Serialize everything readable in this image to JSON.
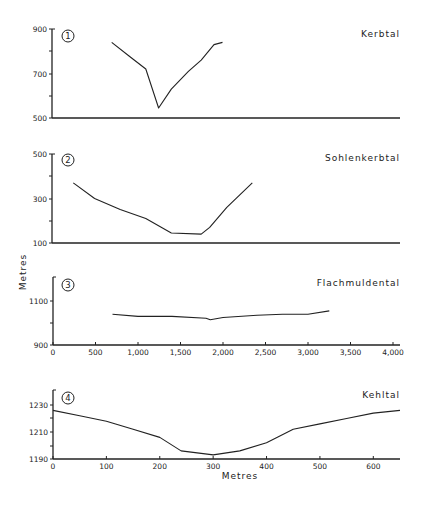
{
  "figure": {
    "y_axis_label": "Metres",
    "x_axis_label": "Metres"
  },
  "chart_data": [
    {
      "type": "line",
      "panel": "1",
      "title": "Kerbtal",
      "xlabel": "",
      "ylabel": "Metres",
      "xlim": [
        0,
        4000
      ],
      "ylim": [
        500,
        900
      ],
      "yticks": [
        "900",
        "700",
        "500"
      ],
      "x": [
        700,
        900,
        1100,
        1250,
        1400,
        1600,
        1750,
        1900,
        2000
      ],
      "values": [
        840,
        780,
        720,
        545,
        630,
        710,
        760,
        830,
        840
      ]
    },
    {
      "type": "line",
      "panel": "2",
      "title": "Sohlenkerbtal",
      "xlabel": "",
      "ylabel": "Metres",
      "xlim": [
        0,
        4000
      ],
      "ylim": [
        100,
        500
      ],
      "yticks": [
        "500",
        "300",
        "100"
      ],
      "x": [
        250,
        500,
        800,
        1100,
        1400,
        1750,
        1850,
        2050,
        2350
      ],
      "values": [
        370,
        300,
        250,
        210,
        145,
        140,
        170,
        260,
        370
      ]
    },
    {
      "type": "line",
      "panel": "3",
      "title": "Flachmuldental",
      "xlabel": "",
      "ylabel": "Metres",
      "xlim": [
        0,
        4000
      ],
      "ylim": [
        900,
        1150
      ],
      "yticks": [
        "1100",
        "900"
      ],
      "xticks": [
        "0",
        "500",
        "1,000",
        "1,500",
        "2,000",
        "2,500",
        "3,000",
        "3,500",
        "4,000"
      ],
      "x": [
        700,
        1000,
        1400,
        1800,
        1850,
        2000,
        2400,
        2700,
        3000,
        3250
      ],
      "values": [
        1040,
        1030,
        1030,
        1022,
        1015,
        1025,
        1035,
        1040,
        1040,
        1055
      ]
    },
    {
      "type": "line",
      "panel": "4",
      "title": "Kehltal",
      "xlabel": "Metres",
      "ylabel": "Metres",
      "xlim": [
        0,
        650
      ],
      "ylim": [
        1190,
        1235
      ],
      "yticks": [
        "1230",
        "1210",
        "1190"
      ],
      "xticks": [
        "0",
        "100",
        "200",
        "300",
        "400",
        "500",
        "600"
      ],
      "x": [
        0,
        50,
        100,
        150,
        200,
        240,
        300,
        350,
        400,
        450,
        500,
        550,
        600,
        650
      ],
      "values": [
        1226,
        1222,
        1218,
        1212,
        1206,
        1196,
        1193,
        1196,
        1202,
        1212,
        1216,
        1220,
        1224,
        1226
      ]
    }
  ]
}
